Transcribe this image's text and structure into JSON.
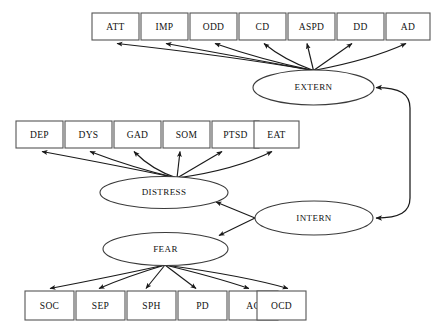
{
  "diagram": {
    "type": "path-diagram",
    "colors": {
      "background": "#ffffff",
      "box_stroke": "#555555",
      "ellipse_stroke": "#3a3a3a",
      "arrow_stroke": "#1a1a1a",
      "label_text": "#111111"
    },
    "latent_factors": [
      {
        "id": "EXTERN",
        "label": "EXTERN",
        "cx": 313.5,
        "cy": 87.5,
        "rx": 60.5,
        "ry": 17.5
      },
      {
        "id": "DISTRESS",
        "label": "DISTRESS",
        "cx": 164.0,
        "cy": 192.5,
        "rx": 64.0,
        "ry": 16.0
      },
      {
        "id": "INTERN",
        "label": "INTERN",
        "cx": 314.0,
        "cy": 218.0,
        "rx": 59.0,
        "ry": 17.0
      },
      {
        "id": "FEAR",
        "label": "FEAR",
        "cx": 165.5,
        "cy": 249.0,
        "rx": 62.5,
        "ry": 16.5
      }
    ],
    "indicator_rows": [
      {
        "row": "externalizing",
        "parent": "EXTERN",
        "y": 13,
        "height": 27,
        "width": 47,
        "indicators": [
          {
            "id": "ATT",
            "label": "ATT",
            "x": 92
          },
          {
            "id": "IMP",
            "label": "IMP",
            "x": 141
          },
          {
            "id": "ODD",
            "label": "ODD",
            "x": 190
          },
          {
            "id": "CD",
            "label": "CD",
            "x": 239
          },
          {
            "id": "ASPD",
            "label": "ASPD",
            "x": 288
          },
          {
            "id": "DD",
            "label": "DD",
            "x": 337
          },
          {
            "id": "AD",
            "label": "AD",
            "x": 386
          }
        ]
      },
      {
        "row": "distress",
        "parent": "DISTRESS",
        "y": 121,
        "height": 27,
        "width": 47,
        "indicators": [
          {
            "id": "DEP",
            "label": "DEP",
            "x": 16
          },
          {
            "id": "DYS",
            "label": "DYS",
            "x": 65
          },
          {
            "id": "GAD",
            "label": "GAD",
            "x": 114
          },
          {
            "id": "SOM",
            "label": "SOM",
            "x": 163
          },
          {
            "id": "PTSD",
            "label": "PTSD",
            "x": 212
          },
          {
            "id": "EAT",
            "label": "EAT",
            "x": 254
          }
        ]
      },
      {
        "row": "fear",
        "parent": "FEAR",
        "y": 291,
        "height": 29,
        "width": 49,
        "indicators": [
          {
            "id": "SOC",
            "label": "SOC",
            "x": 25
          },
          {
            "id": "SEP",
            "label": "SEP",
            "x": 76
          },
          {
            "id": "SPH",
            "label": "SPH",
            "x": 127
          },
          {
            "id": "PD",
            "label": "PD",
            "x": 178
          },
          {
            "id": "AG",
            "label": "AG",
            "x": 229
          },
          {
            "id": "OCD",
            "label": "OCD",
            "x": 257
          }
        ]
      }
    ],
    "structural_paths": [
      {
        "from": "INTERN",
        "to": "DISTRESS",
        "kind": "directed"
      },
      {
        "from": "INTERN",
        "to": "FEAR",
        "kind": "directed"
      },
      {
        "from": "EXTERN",
        "to": "INTERN",
        "kind": "covariance",
        "note": "curved double-headed path on right side"
      }
    ]
  }
}
